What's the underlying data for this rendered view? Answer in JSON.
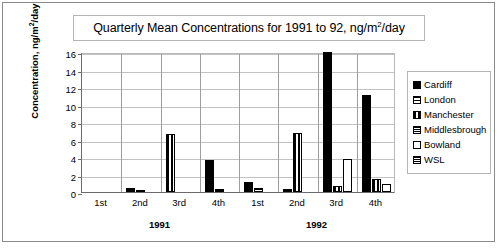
{
  "chart_data": {
    "type": "bar",
    "title_parts": {
      "pre": "Quarterly Mean Concentrations for 1991 to 92, ng/m",
      "sup": "2",
      "post": "/day"
    },
    "xlabel": "",
    "ylabel": "Concentration, ng/m²/day",
    "ylabel_parts": {
      "pre": "Concentration, ng/m",
      "sup": "2",
      "post": "/day"
    },
    "ylim": [
      0,
      16
    ],
    "yticks": [
      0,
      2,
      4,
      6,
      8,
      10,
      12,
      14,
      16
    ],
    "grid": true,
    "legend_position": "right",
    "categories": [
      "1st",
      "2nd",
      "3rd",
      "4th",
      "1st",
      "2nd",
      "3rd",
      "4th"
    ],
    "group_labels": [
      "1991",
      "1992"
    ],
    "series": [
      {
        "name": "Cardiff",
        "pattern": "solid",
        "values": [
          0,
          0.45,
          0,
          3.7,
          1.1,
          0.3,
          16.0,
          11.1
        ]
      },
      {
        "name": "London",
        "pattern": "hline",
        "values": [
          0,
          0.15,
          0,
          0,
          0.5,
          0,
          0,
          0
        ]
      },
      {
        "name": "Manchester",
        "pattern": "vline",
        "values": [
          0,
          0,
          6.6,
          0,
          0,
          6.7,
          0.65,
          1.45
        ]
      },
      {
        "name": "Middlesbrough",
        "pattern": "cross",
        "values": [
          0,
          0,
          0,
          0.35,
          0,
          0,
          0,
          0
        ]
      },
      {
        "name": "Bowland",
        "pattern": "empty",
        "values": [
          0,
          0,
          0,
          0,
          0,
          0,
          3.8,
          0.95
        ]
      },
      {
        "name": "WSL",
        "pattern": "cross",
        "values": [
          0,
          0,
          0,
          0,
          0,
          0,
          0,
          0
        ]
      }
    ]
  },
  "legend": {
    "items": [
      {
        "label": "Cardiff",
        "pattern": "solid"
      },
      {
        "label": "London",
        "pattern": "hline"
      },
      {
        "label": "Manchester",
        "pattern": "vline"
      },
      {
        "label": "Middlesbrough",
        "pattern": "cross"
      },
      {
        "label": "Bowland",
        "pattern": "empty"
      },
      {
        "label": "WSL",
        "pattern": "cross"
      }
    ]
  }
}
